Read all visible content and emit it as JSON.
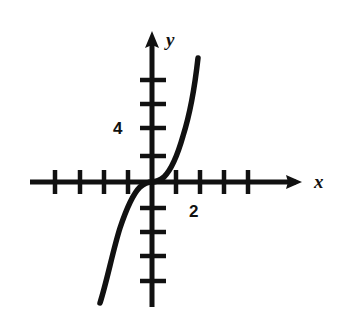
{
  "figure": {
    "background_color": "#ffffff",
    "ink_color": "#111111",
    "width": 340,
    "height": 321
  },
  "axes": {
    "x_axis_label": "x",
    "y_axis_label": "y",
    "origin_px": {
      "x": 152,
      "y": 182
    },
    "unit_px": 24,
    "units_per_tick": 1,
    "x_line": {
      "x1": 30,
      "x2": 302,
      "arrow": "right"
    },
    "y_line": {
      "y1": 32,
      "y2": 307,
      "arrow": "up"
    },
    "x_ticks_px": [
      55,
      80,
      104,
      128,
      176,
      200,
      224,
      248
    ],
    "y_ticks_px": [
      80,
      104,
      128,
      156,
      208,
      232,
      256,
      281
    ]
  },
  "tick_labels": [
    {
      "name": "y-tick-label-4",
      "text": "4",
      "axis": "y",
      "value": 4
    },
    {
      "name": "x-tick-label-2",
      "text": "2",
      "axis": "x",
      "value": 2
    }
  ],
  "chart_data": {
    "type": "line",
    "title": "",
    "xlabel": "x",
    "ylabel": "y",
    "grid": false,
    "legend": null,
    "xlim": [
      -5,
      6
    ],
    "ylim": [
      -5,
      7
    ],
    "xticks": [
      -4,
      -3,
      -2,
      -1,
      1,
      2,
      3,
      4
    ],
    "yticks": [
      -4,
      -3,
      -2,
      -1,
      2,
      3,
      4,
      6
    ],
    "xtick_labels": [
      "",
      "",
      "",
      "",
      "",
      "2",
      "",
      ""
    ],
    "ytick_labels": [
      "",
      "",
      "",
      "",
      "",
      "",
      "4",
      ""
    ],
    "series": [
      {
        "name": "curve",
        "description": "steeply increasing odd cubic-type curve through the origin",
        "x": [
          -2.15,
          -2.05,
          -1.95,
          -1.8,
          -1.6,
          -1.35,
          -1.05,
          -0.7,
          -0.35,
          0.0,
          0.35,
          0.7,
          1.05,
          1.35,
          1.6,
          1.75,
          1.85,
          1.92
        ],
        "y": [
          -5.05,
          -4.3,
          -3.6,
          -2.7,
          -1.85,
          -1.1,
          -0.55,
          -0.22,
          -0.05,
          0.0,
          0.05,
          0.22,
          0.55,
          1.1,
          2.1,
          3.2,
          4.3,
          5.2
        ]
      }
    ]
  },
  "curve_path": "M 100,303 C 107,281 113,250 120,228 C 127,207 134,193 140,187 C 145,183 149,182 152,182 C 155,182 159,181 164,177 C 170,171 177,157 183,136 C 190,114 195,85 198,58"
}
